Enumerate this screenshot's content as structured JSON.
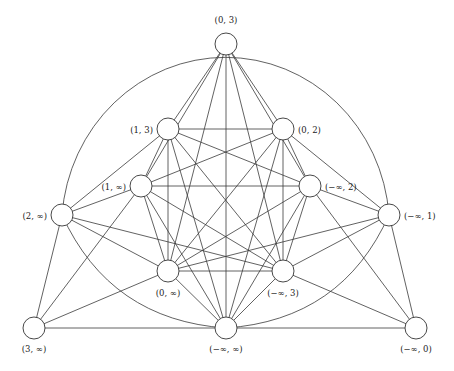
{
  "diagram": {
    "type": "graph",
    "node_radius": 11,
    "nodes": [
      {
        "id": "n03",
        "label": "(0, 3)",
        "x": 226,
        "y": 44,
        "lx": 226,
        "ly": 23,
        "anchor": "middle"
      },
      {
        "id": "n13",
        "label": "(1, 3)",
        "x": 168,
        "y": 129,
        "lx": 153,
        "ly": 133,
        "anchor": "end"
      },
      {
        "id": "n02",
        "label": "(0, 2)",
        "x": 283,
        "y": 129,
        "lx": 298,
        "ly": 133,
        "anchor": "start"
      },
      {
        "id": "n1i",
        "label": "(1, ∞)",
        "x": 141,
        "y": 186,
        "lx": 126,
        "ly": 190,
        "anchor": "end"
      },
      {
        "id": "nm2",
        "label": "(−∞, 2)",
        "x": 310,
        "y": 186,
        "lx": 325,
        "ly": 190,
        "anchor": "start"
      },
      {
        "id": "n2i",
        "label": "(2, ∞)",
        "x": 62,
        "y": 215,
        "lx": 47,
        "ly": 219,
        "anchor": "end"
      },
      {
        "id": "nm1",
        "label": "(−∞, 1)",
        "x": 389,
        "y": 215,
        "lx": 404,
        "ly": 219,
        "anchor": "start"
      },
      {
        "id": "n0i",
        "label": "(0, ∞)",
        "x": 168,
        "y": 271,
        "lx": 168,
        "ly": 296,
        "anchor": "middle"
      },
      {
        "id": "nm3",
        "label": "(−∞, 3)",
        "x": 283,
        "y": 271,
        "lx": 283,
        "ly": 296,
        "anchor": "middle"
      },
      {
        "id": "n3i",
        "label": "(3, ∞)",
        "x": 34,
        "y": 328,
        "lx": 34,
        "ly": 352,
        "anchor": "middle"
      },
      {
        "id": "nmi",
        "label": "(−∞, ∞)",
        "x": 226,
        "y": 328,
        "lx": 226,
        "ly": 352,
        "anchor": "middle"
      },
      {
        "id": "nm0",
        "label": "(−∞, 0)",
        "x": 416,
        "y": 328,
        "lx": 416,
        "ly": 352,
        "anchor": "middle"
      }
    ],
    "edges": [
      [
        "n03",
        "n13"
      ],
      [
        "n03",
        "n02"
      ],
      [
        "n03",
        "n1i"
      ],
      [
        "n03",
        "nm2"
      ],
      [
        "n03",
        "n0i"
      ],
      [
        "n03",
        "nm3"
      ],
      [
        "n03",
        "nmi"
      ],
      [
        "n13",
        "n02"
      ],
      [
        "n13",
        "n1i"
      ],
      [
        "n13",
        "nm2"
      ],
      [
        "n13",
        "n0i"
      ],
      [
        "n13",
        "nm3"
      ],
      [
        "n13",
        "nmi"
      ],
      [
        "n13",
        "n2i"
      ],
      [
        "n02",
        "n1i"
      ],
      [
        "n02",
        "nm2"
      ],
      [
        "n02",
        "n0i"
      ],
      [
        "n02",
        "nm3"
      ],
      [
        "n02",
        "nmi"
      ],
      [
        "n02",
        "nm1"
      ],
      [
        "n1i",
        "nm2"
      ],
      [
        "n1i",
        "n0i"
      ],
      [
        "n1i",
        "nm3"
      ],
      [
        "n1i",
        "nmi"
      ],
      [
        "n1i",
        "n2i"
      ],
      [
        "n1i",
        "n3i"
      ],
      [
        "nm2",
        "n0i"
      ],
      [
        "nm2",
        "nm3"
      ],
      [
        "nm2",
        "nmi"
      ],
      [
        "nm2",
        "nm1"
      ],
      [
        "nm2",
        "nm0"
      ],
      [
        "n0i",
        "nm3"
      ],
      [
        "n0i",
        "nmi"
      ],
      [
        "n0i",
        "n2i"
      ],
      [
        "n0i",
        "n3i"
      ],
      [
        "n0i",
        "nm1"
      ],
      [
        "nm3",
        "nmi"
      ],
      [
        "nm3",
        "nm1"
      ],
      [
        "nm3",
        "nm0"
      ],
      [
        "nm3",
        "n2i"
      ],
      [
        "n2i",
        "n3i"
      ],
      [
        "nm1",
        "nm0"
      ],
      [
        "n3i",
        "nmi"
      ],
      [
        "nmi",
        "nm0"
      ]
    ],
    "arcs": [
      {
        "name": "outer-arc",
        "d": "M 62 215 A 164 171 0 0 1 389 215"
      },
      {
        "name": "left-lower-arc",
        "d": "M 62 215 Q 110 320 226 328"
      },
      {
        "name": "right-lower-arc",
        "d": "M 389 215 Q 342 320 226 328"
      }
    ]
  }
}
